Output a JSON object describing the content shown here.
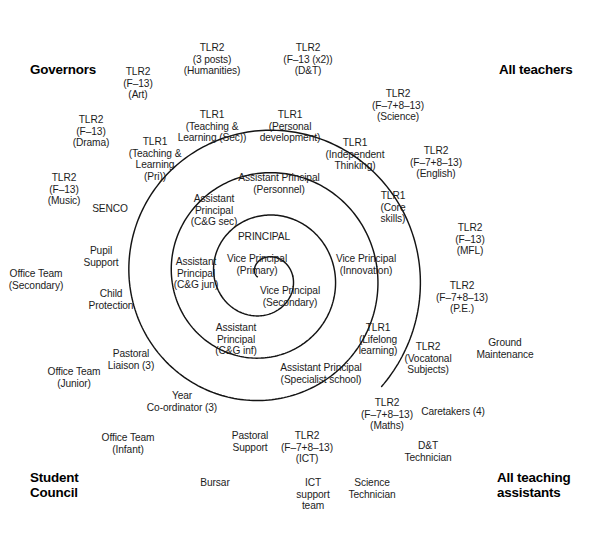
{
  "diagram": {
    "stroke_color": "#141414",
    "background": "#ffffff",
    "corner_labels": [
      {
        "id": "governors",
        "text": "Governors",
        "x": 30,
        "y": 62,
        "align": "left"
      },
      {
        "id": "all-teachers",
        "text": "All teachers",
        "x": 499,
        "y": 62,
        "align": "left"
      },
      {
        "id": "student-council",
        "text": "Student\nCouncil",
        "x": 30,
        "y": 470,
        "align": "left"
      },
      {
        "id": "all-teaching-assts",
        "text": "All teaching\nassistants",
        "x": 497,
        "y": 470,
        "align": "left"
      }
    ],
    "nodes": [
      {
        "id": "principal",
        "text": "PRINCIPAL",
        "x": 264,
        "y": 231,
        "ring": 0
      },
      {
        "id": "vice-principal-primary",
        "text": "Vice Principal\n(Primary)",
        "x": 257,
        "y": 253,
        "ring": 0
      },
      {
        "id": "vice-principal-secondary",
        "text": "Vice Principal\n(Secondary)",
        "x": 290,
        "y": 285,
        "ring": 0
      },
      {
        "id": "vice-principal-innovation",
        "text": "Vice Principal\n(Innovation)",
        "x": 366,
        "y": 253,
        "ring": 1
      },
      {
        "id": "asst-principal-personnel",
        "text": "Assistant Principal\n(Personnel)",
        "x": 279,
        "y": 172,
        "ring": 1
      },
      {
        "id": "asst-principal-cg-sec",
        "text": "Assistant\nPrincipal\n(C&G sec)",
        "x": 214,
        "y": 193,
        "ring": 1
      },
      {
        "id": "asst-principal-cg-jun",
        "text": "Assistant\nPrincipal\n(C&G jun)",
        "x": 196,
        "y": 256,
        "ring": 1
      },
      {
        "id": "asst-principal-cg-inf",
        "text": "Assistant\nPrincipal\n(C&G inf)",
        "x": 236,
        "y": 322,
        "ring": 1
      },
      {
        "id": "asst-principal-specialist",
        "text": "Assistant Principal\n(Specialist school)",
        "x": 321,
        "y": 362,
        "ring": 1
      },
      {
        "id": "tlr1-teaching-learning-pri",
        "text": "TLR1\n(Teaching &\nLearning\n(Pri))",
        "x": 155,
        "y": 136,
        "ring": 2
      },
      {
        "id": "tlr1-teaching-learning-sec",
        "text": "TLR1\n(Teaching &\nLearning (Sec))",
        "x": 212,
        "y": 109,
        "ring": 2
      },
      {
        "id": "tlr1-personal-development",
        "text": "TLR1\n(Personal\ndevelopment)",
        "x": 290,
        "y": 109,
        "ring": 2
      },
      {
        "id": "tlr1-independent-thinking",
        "text": "TLR1\n(Independent\nThinking)",
        "x": 355,
        "y": 137,
        "ring": 2
      },
      {
        "id": "tlr1-core-skills",
        "text": "TLR1\n(Core\nskills)",
        "x": 393,
        "y": 190,
        "ring": 2
      },
      {
        "id": "tlr1-lifelong-learning",
        "text": "TLR1\n(Lifelong\nlearning)",
        "x": 378,
        "y": 322,
        "ring": 2
      },
      {
        "id": "senco",
        "text": "SENCO",
        "x": 110,
        "y": 203,
        "ring": 3
      },
      {
        "id": "pupil-support",
        "text": "Pupil\nSupport",
        "x": 101,
        "y": 245,
        "ring": 3
      },
      {
        "id": "child-protection",
        "text": "Child\nProtection",
        "x": 111,
        "y": 288,
        "ring": 3
      },
      {
        "id": "pastoral-liaison",
        "text": "Pastoral\nLiaison (3)",
        "x": 131,
        "y": 348,
        "ring": 3
      },
      {
        "id": "year-coordinator",
        "text": "Year\nCo-ordinator (3)",
        "x": 182,
        "y": 390,
        "ring": 3
      },
      {
        "id": "pastoral-support",
        "text": "Pastoral\nSupport",
        "x": 250,
        "y": 430,
        "ring": 3
      },
      {
        "id": "tlr2-art",
        "text": "TLR2\n(F–13)\n(Art)",
        "x": 138,
        "y": 66,
        "ring": 4
      },
      {
        "id": "tlr2-humanities",
        "text": "TLR2\n(3 posts)\n(Humanities)",
        "x": 212,
        "y": 42,
        "ring": 4
      },
      {
        "id": "tlr2-dt",
        "text": "TLR2\n(F–13 (x2))\n(D&T)",
        "x": 308,
        "y": 42,
        "ring": 4
      },
      {
        "id": "tlr2-science",
        "text": "TLR2\n(F–7+8–13)\n(Science)",
        "x": 398,
        "y": 88,
        "ring": 4
      },
      {
        "id": "tlr2-english",
        "text": "TLR2\n(F–7+8–13)\n(English)",
        "x": 436,
        "y": 145,
        "ring": 4
      },
      {
        "id": "tlr2-mfl",
        "text": "TLR2\n(F–13)\n(MFL)",
        "x": 470,
        "y": 222,
        "ring": 4
      },
      {
        "id": "tlr2-pe",
        "text": "TLR2\n(F–7+8–13)\n(P.E.)",
        "x": 462,
        "y": 280,
        "ring": 4
      },
      {
        "id": "tlr2-vocational",
        "text": "TLR2\n(Vocatonal\nSubjects)",
        "x": 428,
        "y": 341,
        "ring": 4
      },
      {
        "id": "tlr2-maths",
        "text": "TLR2\n(F–7+8–13)\n(Maths)",
        "x": 387,
        "y": 397,
        "ring": 4
      },
      {
        "id": "tlr2-ict",
        "text": "TLR2\n(F–7+8–13)\n(ICT)",
        "x": 307,
        "y": 430,
        "ring": 4
      },
      {
        "id": "tlr2-drama",
        "text": "TLR2\n(F–13)\n(Drama)",
        "x": 91,
        "y": 114,
        "ring": 5
      },
      {
        "id": "tlr2-music",
        "text": "TLR2\n(F–13)\n(Music)",
        "x": 64,
        "y": 172,
        "ring": 5
      },
      {
        "id": "office-team-secondary",
        "text": "Office Team\n(Secondary)",
        "x": 36,
        "y": 268,
        "ring": 5
      },
      {
        "id": "office-team-junior",
        "text": "Office Team\n(Junior)",
        "x": 74,
        "y": 366,
        "ring": 5
      },
      {
        "id": "office-team-infant",
        "text": "Office Team\n(Infant)",
        "x": 128,
        "y": 432,
        "ring": 5
      },
      {
        "id": "bursar",
        "text": "Bursar",
        "x": 215,
        "y": 477,
        "ring": 5
      },
      {
        "id": "ict-support-team",
        "text": "ICT\nsupport\nteam",
        "x": 313,
        "y": 477,
        "ring": 5
      },
      {
        "id": "science-technician",
        "text": "Science\nTechnician",
        "x": 372,
        "y": 477,
        "ring": 5
      },
      {
        "id": "dt-technician",
        "text": "D&T\nTechnician",
        "x": 428,
        "y": 440,
        "ring": 5
      },
      {
        "id": "caretakers",
        "text": "Caretakers (4)",
        "x": 453,
        "y": 406,
        "ring": 5
      },
      {
        "id": "ground-maintenance",
        "text": "Ground\nMaintenance",
        "x": 505,
        "y": 337,
        "ring": 5
      }
    ]
  }
}
